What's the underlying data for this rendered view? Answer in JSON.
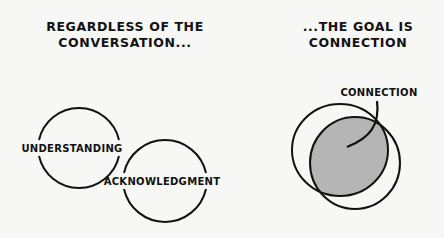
{
  "left_panel": {
    "title_line1": "REGARDLESS OF THE",
    "title_line2": "CONVERSATION...",
    "circles": [
      {
        "label": "UNDERSTANDING"
      },
      {
        "label": "ACKNOWLEDGMENT"
      }
    ]
  },
  "right_panel": {
    "title_line1": "...THE GOAL IS",
    "title_line2": "CONNECTION",
    "overlap_label": "CONNECTION",
    "overlap_fill": "#b5b5b5"
  },
  "colors": {
    "background": "#f7f7f5",
    "stroke": "#111111"
  }
}
